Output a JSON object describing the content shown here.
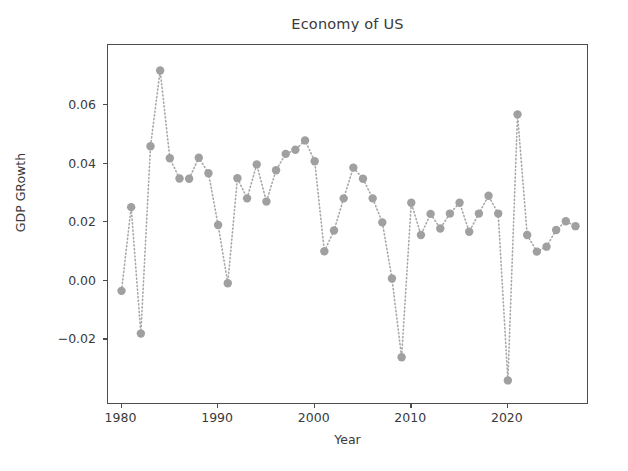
{
  "chart_data": {
    "type": "line",
    "title": "Economy of US",
    "xlabel": "Year",
    "ylabel": "GDP GRowth",
    "marker": "circle",
    "linestyle": "dotted",
    "color": "#a0a0a0",
    "grid": false,
    "legend": null,
    "xlim": [
      1978.6,
      2028.4
    ],
    "ylim": [
      -0.0425,
      0.0805
    ],
    "xticks": [
      1980,
      1990,
      2000,
      2010,
      2020
    ],
    "xticklabels": [
      "1980",
      "1990",
      "2000",
      "2010",
      "2020"
    ],
    "yticks": [
      -0.02,
      0.0,
      0.02,
      0.04,
      0.06
    ],
    "yticklabels": [
      "−0.02",
      "0.00",
      "0.02",
      "0.04",
      "0.06"
    ],
    "x": [
      1980,
      1981,
      1982,
      1983,
      1984,
      1985,
      1986,
      1987,
      1988,
      1989,
      1990,
      1991,
      1992,
      1993,
      1994,
      1995,
      1996,
      1997,
      1998,
      1999,
      2000,
      2001,
      2002,
      2003,
      2004,
      2005,
      2006,
      2007,
      2008,
      2009,
      2010,
      2011,
      2012,
      2013,
      2014,
      2015,
      2016,
      2017,
      2018,
      2019,
      2020,
      2021,
      2022,
      2023,
      2024,
      2025,
      2026,
      2027
    ],
    "values": [
      -0.0035,
      0.0251,
      -0.0181,
      0.0459,
      0.0718,
      0.0418,
      0.0349,
      0.0348,
      0.042,
      0.0367,
      0.019,
      -0.0009,
      0.035,
      0.0281,
      0.0397,
      0.027,
      0.0377,
      0.0433,
      0.0447,
      0.0479,
      0.0408,
      0.01,
      0.0171,
      0.0281,
      0.0386,
      0.0348,
      0.0281,
      0.0199,
      0.0007,
      -0.0262,
      0.0266,
      0.0156,
      0.0228,
      0.0178,
      0.0229,
      0.0266,
      0.0167,
      0.0229,
      0.029,
      0.0229,
      -0.0341,
      0.0568,
      0.0156,
      0.0099,
      0.0116,
      0.0173,
      0.0203,
      0.0186
    ]
  }
}
